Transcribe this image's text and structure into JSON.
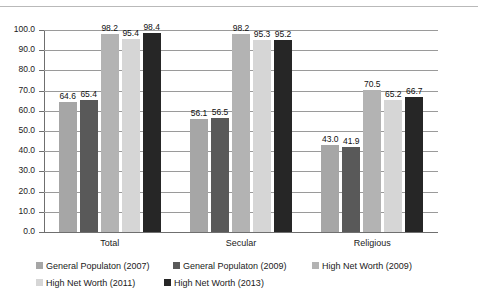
{
  "chart_data": {
    "type": "bar",
    "title": "",
    "xlabel": "",
    "ylabel": "",
    "ylim": [
      0,
      100
    ],
    "ytick_labels": [
      "100.0",
      "90.0",
      "80.0",
      "70.0",
      "60.0",
      "50.0",
      "40.0",
      "30.0",
      "20.0",
      "10.0",
      "0.0"
    ],
    "ytick_values": [
      100,
      90,
      80,
      70,
      60,
      50,
      40,
      30,
      20,
      10,
      0
    ],
    "grid": true,
    "legend_position": "bottom",
    "categories": [
      "Total",
      "Secular",
      "Religious"
    ],
    "series": [
      {
        "name": "General Populaton (2007)",
        "color": "#a6a6a6",
        "values": [
          64.6,
          56.1,
          43.0
        ],
        "labels": [
          "64.6",
          "56.1",
          "43.0"
        ]
      },
      {
        "name": "General Populaton (2009)",
        "color": "#595959",
        "values": [
          65.4,
          56.5,
          41.9
        ],
        "labels": [
          "65.4",
          "56.5",
          "41.9"
        ]
      },
      {
        "name": "High Net Worth (2009)",
        "color": "#b3b3b3",
        "values": [
          98.2,
          98.2,
          70.5
        ],
        "labels": [
          "98.2",
          "98.2",
          "70.5"
        ]
      },
      {
        "name": "High Net Worth (2011)",
        "color": "#d6d6d6",
        "values": [
          95.4,
          95.3,
          65.2
        ],
        "labels": [
          "95.4",
          "95.3",
          "65.2"
        ]
      },
      {
        "name": "High Net Worth (2013)",
        "color": "#262626",
        "values": [
          98.4,
          95.2,
          66.7
        ],
        "labels": [
          "98.4",
          "95.2",
          "66.7"
        ]
      }
    ]
  },
  "axis": {
    "y": {
      "t0": "100.0",
      "t1": "90.0",
      "t2": "80.0",
      "t3": "70.0",
      "t4": "60.0",
      "t5": "50.0",
      "t6": "40.0",
      "t7": "30.0",
      "t8": "20.0",
      "t9": "10.0",
      "t10": "0.0"
    },
    "categories": {
      "c0": "Total",
      "c1": "Secular",
      "c2": "Religious"
    }
  },
  "legend": {
    "items": [
      {
        "label": "General Populaton (2007)",
        "color": "#a6a6a6"
      },
      {
        "label": "General Populaton (2009)",
        "color": "#595959"
      },
      {
        "label": "High Net Worth (2009)",
        "color": "#b3b3b3"
      },
      {
        "label": "High Net Worth (2011)",
        "color": "#d6d6d6"
      },
      {
        "label": "High Net Worth (2013)",
        "color": "#262626"
      }
    ]
  },
  "values": {
    "total": {
      "s0": "64.6",
      "s1": "65.4",
      "s2": "98.2",
      "s3": "95.4",
      "s4": "98.4"
    },
    "secular": {
      "s0": "56.1",
      "s1": "56.5",
      "s2": "98.2",
      "s3": "95.3",
      "s4": "95.2"
    },
    "religious": {
      "s0": "43.0",
      "s1": "41.9",
      "s2": "70.5",
      "s3": "65.2",
      "s4": "66.7"
    }
  },
  "title_sliver": ""
}
